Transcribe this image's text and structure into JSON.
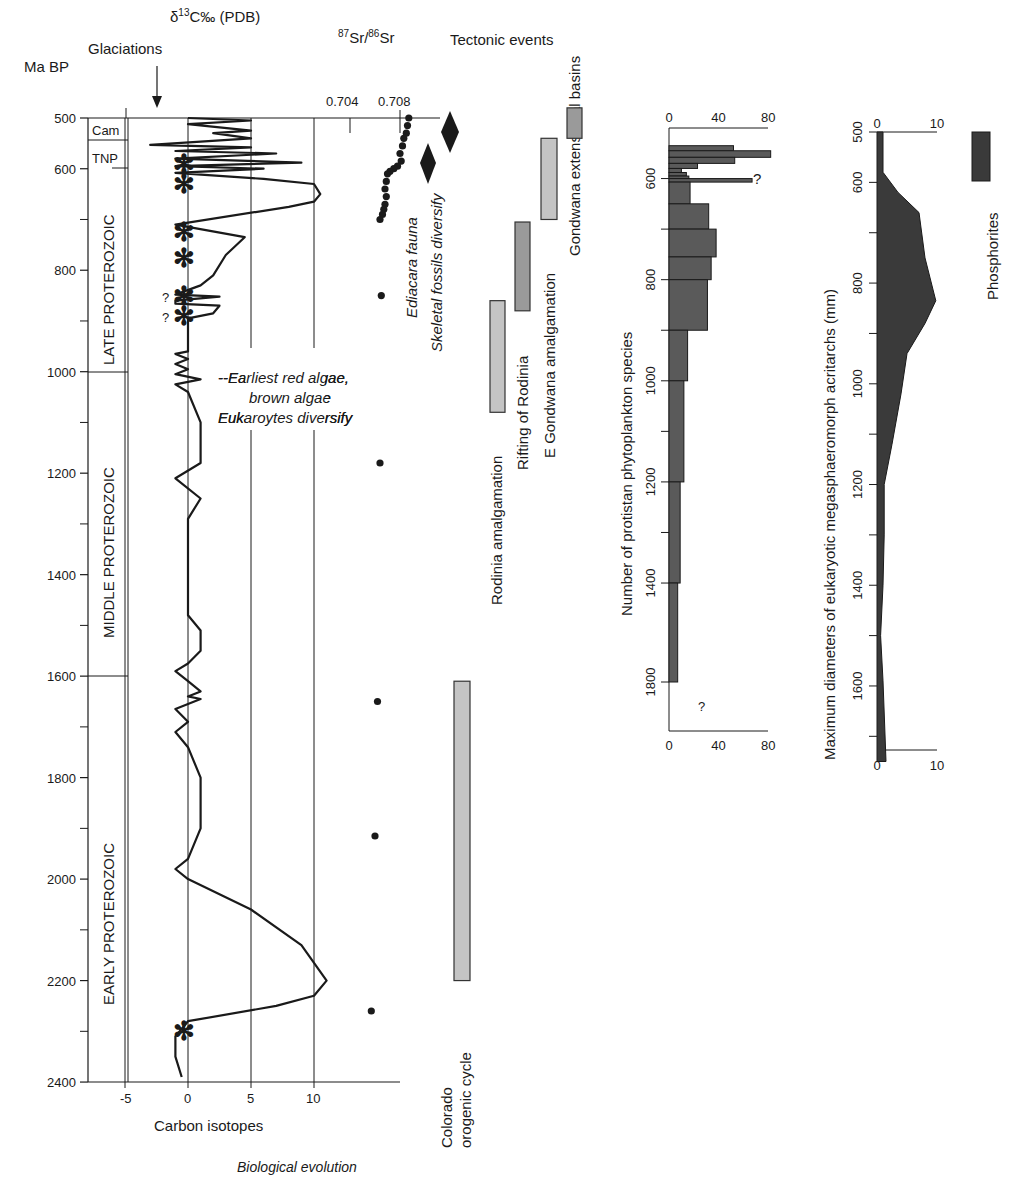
{
  "chart_data": [
    {
      "id": "main",
      "type": "line",
      "title": "Biological evolution",
      "ylabel": "Ma BP",
      "xlabel": "Carbon isotopes",
      "top_label": "δ13C‰ (PDB)",
      "glaciations_label": "Glaciations",
      "y_ticks": [
        500,
        600,
        800,
        1000,
        1200,
        1400,
        1600,
        1800,
        2000,
        2200,
        2400
      ],
      "y_minor_ticks": [
        700,
        900,
        1100,
        1300,
        1500,
        1700,
        1900,
        2100,
        2300
      ],
      "ylim": [
        500,
        2400
      ],
      "x_ticks": [
        -5,
        0,
        5,
        10
      ],
      "xlim": [
        -8,
        17
      ],
      "grid_x": [
        -5,
        0,
        5,
        10
      ],
      "eras": [
        {
          "label": "Cam",
          "from": 500,
          "to": 545
        },
        {
          "label": "TNP",
          "from": 545,
          "to": 600
        },
        {
          "label": "LATE PROTEROZOIC",
          "from": 545,
          "to": 1000
        },
        {
          "label": "MIDDLE PROTEROZOIC",
          "from": 1000,
          "to": 1600
        },
        {
          "label": "EARLY PROTEROZOIC",
          "from": 1600,
          "to": 2400
        }
      ],
      "glaciations": [
        {
          "age": 590,
          "uncertain": false
        },
        {
          "age": 630,
          "uncertain": false
        },
        {
          "age": 725,
          "uncertain": false
        },
        {
          "age": 775,
          "uncertain": false
        },
        {
          "age": 850,
          "uncertain": true
        },
        {
          "age": 890,
          "uncertain": true
        },
        {
          "age": 2300,
          "uncertain": false
        }
      ],
      "carbon_isotope_curve": {
        "name": "δ13C",
        "points": [
          [
            0,
            500
          ],
          [
            5,
            505
          ],
          [
            0,
            512
          ],
          [
            5,
            525
          ],
          [
            2,
            530
          ],
          [
            5,
            540
          ],
          [
            -3,
            553
          ],
          [
            5,
            558
          ],
          [
            -1,
            565
          ],
          [
            7,
            570
          ],
          [
            -1,
            580
          ],
          [
            9,
            588
          ],
          [
            -1,
            595
          ],
          [
            6,
            600
          ],
          [
            -1,
            608
          ],
          [
            6,
            620
          ],
          [
            10,
            630
          ],
          [
            10.5,
            650
          ],
          [
            10,
            665
          ],
          [
            8,
            675
          ],
          [
            -1,
            710
          ],
          [
            4.5,
            735
          ],
          [
            3,
            770
          ],
          [
            2,
            810
          ],
          [
            1,
            830
          ],
          [
            -1,
            848
          ],
          [
            2.5,
            852
          ],
          [
            -1,
            860
          ],
          [
            -1,
            866
          ],
          [
            2.5,
            870
          ],
          [
            2,
            885
          ],
          [
            0,
            895
          ],
          [
            0,
            960
          ],
          [
            -1,
            965
          ],
          [
            0,
            975
          ],
          [
            -1,
            985
          ],
          [
            0,
            995
          ],
          [
            -1,
            1005
          ],
          [
            1,
            1015
          ],
          [
            -1,
            1025
          ],
          [
            0,
            1040
          ],
          [
            1,
            1100
          ],
          [
            1,
            1180
          ],
          [
            -1,
            1210
          ],
          [
            1,
            1250
          ],
          [
            0,
            1290
          ],
          [
            0,
            1480
          ],
          [
            1,
            1510
          ],
          [
            1,
            1550
          ],
          [
            0,
            1575
          ],
          [
            -1,
            1590
          ],
          [
            0,
            1610
          ],
          [
            1,
            1630
          ],
          [
            0,
            1640
          ],
          [
            1,
            1645
          ],
          [
            -1,
            1665
          ],
          [
            0,
            1690
          ],
          [
            -1,
            1710
          ],
          [
            0,
            1740
          ],
          [
            1,
            1800
          ],
          [
            1,
            1900
          ],
          [
            0,
            1960
          ],
          [
            -1,
            1980
          ],
          [
            0,
            2000
          ],
          [
            5,
            2060
          ],
          [
            9,
            2130
          ],
          [
            11,
            2200
          ],
          [
            10,
            2230
          ],
          [
            7,
            2250
          ],
          [
            0,
            2280
          ],
          [
            -1,
            2310
          ],
          [
            -1,
            2350
          ],
          [
            -0.5,
            2390
          ]
        ]
      }
    },
    {
      "id": "strontium",
      "type": "scatter",
      "title": "87Sr/86Sr",
      "x_ticks": [
        0.704,
        0.708
      ],
      "points": [
        [
          0.7087,
          500
        ],
        [
          0.7086,
          515
        ],
        [
          0.7085,
          530
        ],
        [
          0.7083,
          540
        ],
        [
          0.7082,
          555
        ],
        [
          0.708,
          570
        ],
        [
          0.7081,
          585
        ],
        [
          0.7078,
          595
        ],
        [
          0.7075,
          600
        ],
        [
          0.7072,
          605
        ],
        [
          0.707,
          610
        ],
        [
          0.7069,
          625
        ],
        [
          0.7068,
          640
        ],
        [
          0.7069,
          655
        ],
        [
          0.7068,
          670
        ],
        [
          0.7067,
          680
        ],
        [
          0.7066,
          690
        ],
        [
          0.7064,
          700
        ],
        [
          0.7065,
          850
        ],
        [
          0.7064,
          1180
        ],
        [
          0.7062,
          1650
        ],
        [
          0.706,
          1915
        ],
        [
          0.7057,
          2260
        ]
      ]
    },
    {
      "id": "tectonic",
      "type": "bar",
      "title": "Tectonic events",
      "bars": [
        {
          "label": "Rodinia amalgamation",
          "from": 860,
          "to": 1080,
          "shade": "light"
        },
        {
          "label": "Rifting of Rodinia",
          "from": 705,
          "to": 880,
          "shade": "dark"
        },
        {
          "label": "E Gondwana amalgamation",
          "from": 540,
          "to": 700,
          "shade": "light"
        },
        {
          "label": "Gondwana extensional basins",
          "from": 480,
          "to": 540,
          "shade": "dark"
        },
        {
          "label": "Colorado orogenic cycle",
          "from": 1610,
          "to": 2200,
          "shade": "light"
        }
      ],
      "events": [
        {
          "label": "Ediacara fauna",
          "age": 580,
          "marker": "diamond"
        },
        {
          "label": "Skeletal fossils diversify",
          "age": 520,
          "marker": "diamond"
        }
      ],
      "annotation": "--Earliest red algae, brown algae Eukaroytes diversify"
    },
    {
      "id": "phytoplankton",
      "type": "bar",
      "ylabel": "Number of protistan phytoplankton species",
      "x_ticks": [
        0,
        40,
        80
      ],
      "xlim": [
        0,
        85
      ],
      "y_ticks": [
        600,
        800,
        1000,
        1200,
        1400,
        1800
      ],
      "bars": [
        {
          "from": 535,
          "to": 545,
          "value": 52
        },
        {
          "from": 545,
          "to": 558,
          "value": 82
        },
        {
          "from": 558,
          "to": 570,
          "value": 53
        },
        {
          "from": 570,
          "to": 580,
          "value": 23
        },
        {
          "from": 580,
          "to": 588,
          "value": 10
        },
        {
          "from": 588,
          "to": 595,
          "value": 14
        },
        {
          "from": 595,
          "to": 600,
          "value": 16
        },
        {
          "from": 600,
          "to": 607,
          "value": 67,
          "note": "?"
        },
        {
          "from": 607,
          "to": 650,
          "value": 17
        },
        {
          "from": 650,
          "to": 700,
          "value": 32
        },
        {
          "from": 700,
          "to": 755,
          "value": 38
        },
        {
          "from": 755,
          "to": 800,
          "value": 34
        },
        {
          "from": 800,
          "to": 900,
          "value": 31
        },
        {
          "from": 900,
          "to": 1000,
          "value": 15
        },
        {
          "from": 1000,
          "to": 1200,
          "value": 12
        },
        {
          "from": 1200,
          "to": 1400,
          "value": 9
        },
        {
          "from": 1400,
          "to": 1800,
          "value": 7
        }
      ]
    },
    {
      "id": "acritarchs",
      "type": "area",
      "ylabel": "Maximum diameters of eukaryotic megasphaeromorph acritarchs (mm)",
      "x_ticks": [
        0,
        10
      ],
      "xlim": [
        0,
        10
      ],
      "y_ticks": [
        500,
        600,
        800,
        1000,
        1200,
        1400,
        1600
      ],
      "points": [
        [
          1,
          500
        ],
        [
          1,
          580
        ],
        [
          3.5,
          620
        ],
        [
          7,
          660
        ],
        [
          8,
          750
        ],
        [
          9.8,
          835
        ],
        [
          8,
          880
        ],
        [
          5,
          940
        ],
        [
          4,
          1020
        ],
        [
          2.5,
          1120
        ],
        [
          1.2,
          1200
        ],
        [
          1.2,
          1300
        ],
        [
          1,
          1400
        ],
        [
          0.6,
          1500
        ],
        [
          1,
          1590
        ],
        [
          1.5,
          1750
        ]
      ]
    },
    {
      "id": "phosphorites",
      "type": "bar",
      "label": "Phosphorites",
      "from": 500,
      "to": 600
    }
  ],
  "labels": {
    "ma_bp": "Ma BP",
    "glaciations": "Glaciations",
    "d13c": "δ",
    "d13c_sup": "13",
    "d13c_rest": "C‰ (PDB)",
    "sr_87": "87",
    "sr_mid": "Sr/",
    "sr_86": "86",
    "sr_end": "Sr",
    "tectonic_events": "Tectonic events",
    "carbon_isotopes": "Carbon isotopes",
    "biological_evolution": "Biological evolution",
    "ediacara": "Ediacara fauna",
    "skeletal": "Skeletal fossils diversify",
    "algae_1": "--Earliest red algae,",
    "algae_2": "brown algae",
    "algae_3": "Eukaroytes diversify",
    "cam": "Cam",
    "tnp": "TNP",
    "late": "LATE PROTEROZOIC",
    "middle": "MIDDLE PROTEROZOIC",
    "early": "EARLY PROTEROZOIC",
    "rodinia_amalg": "Rodinia amalgamation",
    "rifting": "Rifting of Rodinia",
    "egondwana": "E Gondwana amalgamation",
    "gondwana_ext": "Gondwana extensional basins",
    "colorado_1": "Colorado",
    "colorado_2": "orogenic cycle",
    "phyto_label": "Number of protistan phytoplankton species",
    "acri_label": "Maximum diameters of eukaryotic megasphaeromorph acritarchs (mm)",
    "phosphorites": "Phosphorites",
    "question": "?",
    "q_mark": "?",
    "glaciation_symbol": "✻"
  },
  "colors": {
    "ink": "#1a1a1a",
    "bar_dark": "#5a5a5a",
    "bar_light": "#c4c4c4",
    "area": "#3a3a3a"
  }
}
